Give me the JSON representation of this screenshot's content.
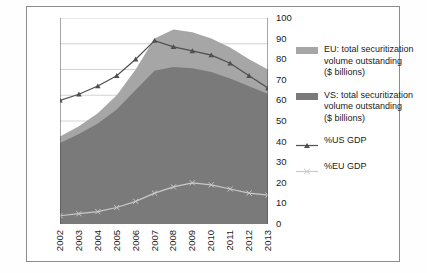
{
  "colors": {
    "eu_area": "#a6a6a6",
    "us_area": "#7a7a7a",
    "us_line": "#4f4f4f",
    "eu_line": "#c9c9c9",
    "grid": "#c0c0c0",
    "axis": "#4a4a4a",
    "frame": "#8c8c8c"
  },
  "legend": {
    "position": "right",
    "items": [
      {
        "name": "legend-eu-area",
        "type": "area",
        "color": "#a6a6a6",
        "lines": [
          "EU: total securitization",
          "volume outstanding",
          "($ billions)"
        ]
      },
      {
        "name": "legend-us-area",
        "type": "area",
        "color": "#7a7a7a",
        "lines": [
          "VS: total securitization",
          "volume outstanding",
          "($ billions)"
        ]
      },
      {
        "name": "legend-us-gdp-line",
        "type": "line",
        "color": "#4f4f4f",
        "lines": [
          "%US GDP"
        ]
      },
      {
        "name": "legend-eu-gdp-line",
        "type": "line",
        "color": "#c9c9c9",
        "lines": [
          "%EU GDP"
        ]
      }
    ]
  },
  "chart_data": {
    "type": "area",
    "title": "",
    "xlabel": "",
    "ylabel": "",
    "grid": true,
    "categories": [
      "2002",
      "2003",
      "2004",
      "2005",
      "2006",
      "2007",
      "2008",
      "2009",
      "2010",
      "2011",
      "2012",
      "2013"
    ],
    "left_axis": {
      "label": "$ billions",
      "min": 0,
      "max": 16000,
      "step": 2000,
      "ticks": [
        "0",
        "2,000",
        "4,000",
        "6,000",
        "8,000",
        "10,000",
        "12,000",
        "14,000",
        "16,000"
      ]
    },
    "right_axis": {
      "label": "% GDP",
      "min": 0,
      "max": 100,
      "step": 10,
      "ticks": [
        "0",
        "10",
        "20",
        "30",
        "40",
        "50",
        "60",
        "70",
        "80",
        "90",
        "100"
      ]
    },
    "series": [
      {
        "name": "VS: total securitization volume outstanding ($ billions)",
        "short": "US area",
        "type": "area",
        "stacked": true,
        "axis": "left",
        "color": "#7a7a7a",
        "values": [
          6300,
          7000,
          7800,
          8900,
          10400,
          11900,
          12200,
          12100,
          11800,
          11300,
          10700,
          10100
        ]
      },
      {
        "name": "EU: total securitization volume outstanding ($ billions)",
        "short": "EU area",
        "type": "area",
        "stacked": true,
        "axis": "left",
        "color": "#a6a6a6",
        "values": [
          500,
          600,
          800,
          1100,
          1600,
          2500,
          2900,
          2800,
          2600,
          2400,
          2100,
          1900
        ]
      },
      {
        "name": "%US GDP",
        "type": "line",
        "axis": "right",
        "color": "#4f4f4f",
        "marker": "triangle",
        "values": [
          60,
          63,
          67,
          72,
          80,
          89,
          86,
          84,
          82,
          78,
          72,
          66
        ]
      },
      {
        "name": "%EU GDP",
        "type": "line",
        "axis": "right",
        "color": "#c9c9c9",
        "marker": "cross",
        "values": [
          4,
          5,
          6,
          8,
          11,
          15,
          18,
          20,
          19,
          17,
          15,
          14
        ]
      }
    ]
  }
}
